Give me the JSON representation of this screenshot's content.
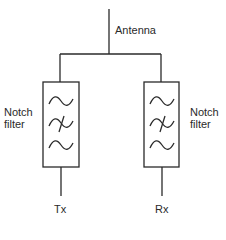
{
  "diagram": {
    "antenna": {
      "label": "Antenna"
    },
    "filters": [
      {
        "side": "left",
        "label_line1": "Notch",
        "label_line2": "filter",
        "port_label": "Tx",
        "symbols": [
          "sine",
          "crossed-sine",
          "sine"
        ]
      },
      {
        "side": "right",
        "label_line1": "Notch",
        "label_line2": "filter",
        "port_label": "Rx",
        "symbols": [
          "sine",
          "crossed-sine",
          "sine"
        ]
      }
    ],
    "colors": {
      "stroke": "#2a2a2a",
      "background": "#ffffff"
    }
  }
}
